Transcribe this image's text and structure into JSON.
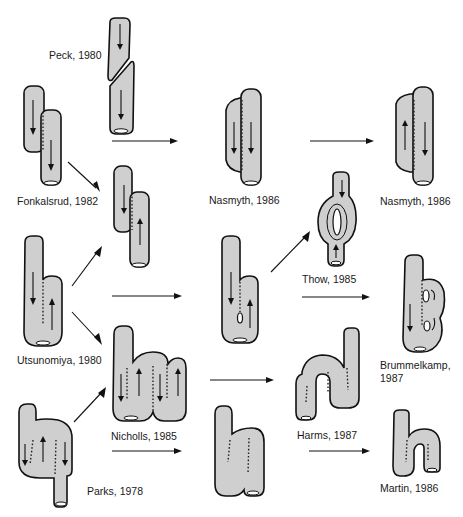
{
  "figure": {
    "type": "diagram",
    "labels": [
      {
        "id": "peck",
        "text": "Peck, 1980"
      },
      {
        "id": "fonkalsrud",
        "text": "Fonkalsrud, 1982"
      },
      {
        "id": "utsunomiya",
        "text": "Utsunomiya, 1980"
      },
      {
        "id": "parks",
        "text": "Parks, 1978"
      },
      {
        "id": "nicholls",
        "text": "Nicholls, 1985"
      },
      {
        "id": "nasmyth_mid",
        "text": "Nasmyth, 1986"
      },
      {
        "id": "thow",
        "text": "Thow, 1985"
      },
      {
        "id": "harms",
        "text": "Harms, 1987"
      },
      {
        "id": "nasmyth_right",
        "text": "Nasmyth, 1986"
      },
      {
        "id": "brummelkamp_1",
        "text": "Brummelkamp,"
      },
      {
        "id": "brummelkamp_2",
        "text": "1987"
      },
      {
        "id": "martin",
        "text": "Martin, 1986"
      }
    ],
    "icons": [
      "straight-pouch-icon",
      "j-pouch-icon",
      "s-pouch-icon",
      "w-pouch-icon",
      "arrow-icon"
    ]
  }
}
